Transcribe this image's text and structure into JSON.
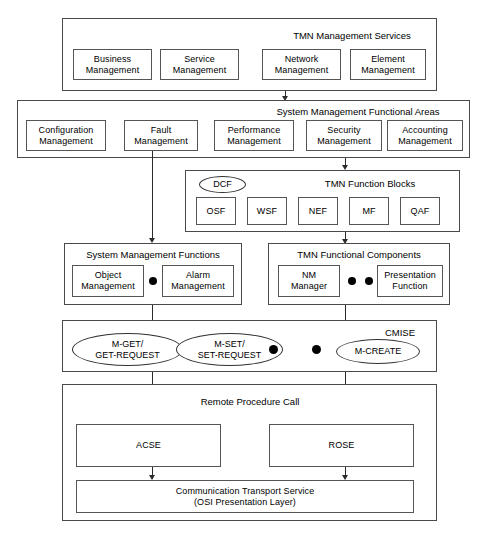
{
  "diagram": {
    "type": "layered-block-diagram",
    "background_color": "#ffffff",
    "line_color": "#2b2b2b",
    "box_border_color": "#555555"
  },
  "layers": {
    "tmn_management_services": {
      "title": "TMN Management Services",
      "boxes": [
        {
          "line1": "Business",
          "line2": "Management"
        },
        {
          "line1": "Service",
          "line2": "Management"
        },
        {
          "line1": "Network",
          "line2": "Management"
        },
        {
          "line1": "Element",
          "line2": "Management"
        }
      ]
    },
    "system_management_functional_areas": {
      "title": "System Management Functional Areas",
      "boxes": [
        {
          "line1": "Configuration",
          "line2": "Management"
        },
        {
          "line1": "Fault",
          "line2": "Management"
        },
        {
          "line1": "Performance",
          "line2": "Management"
        },
        {
          "line1": "Security",
          "line2": "Management"
        },
        {
          "line1": "Accounting",
          "line2": "Management"
        }
      ]
    },
    "tmn_function_blocks": {
      "title": "TMN Function Blocks",
      "badge": "DCF",
      "boxes": [
        {
          "line1": "OSF"
        },
        {
          "line1": "WSF"
        },
        {
          "line1": "NEF"
        },
        {
          "line1": "MF"
        },
        {
          "line1": "QAF"
        }
      ]
    },
    "system_management_functions": {
      "title": "System Management Functions",
      "boxes": [
        {
          "line1": "Object",
          "line2": "Management"
        },
        {
          "line1": "Alarm",
          "line2": "Management"
        }
      ],
      "separator_dots": 1
    },
    "tmn_functional_components": {
      "title": "TMN Functional Components",
      "boxes": [
        {
          "line1": "NM",
          "line2": "Manager"
        },
        {
          "line1": "Presentation",
          "line2": "Function"
        }
      ],
      "separator_dots": 2
    },
    "cmise": {
      "title": "CMISE",
      "ellipses": [
        {
          "line1": "M-GET/",
          "line2": "GET-REQUEST"
        },
        {
          "line1": "M-SET/",
          "line2": "SET-REQUEST"
        },
        {
          "line1": "M-CREATE"
        }
      ],
      "separator_dots": 2
    },
    "remote_procedure_call": {
      "title": "Remote Procedure Call",
      "boxes": [
        {
          "line1": "ACSE"
        },
        {
          "line1": "ROSE"
        }
      ],
      "transport": {
        "line1": "Communication Transport Service",
        "line2": "(OSI Presentation Layer)"
      }
    }
  }
}
